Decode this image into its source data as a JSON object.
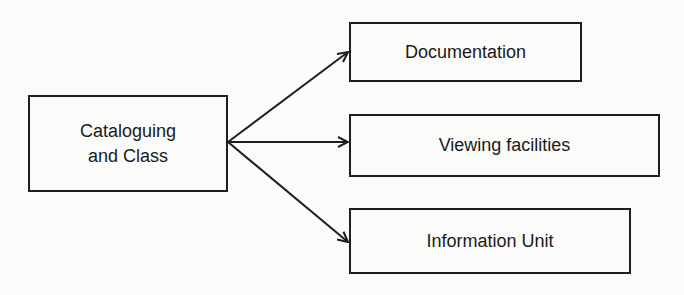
{
  "diagram": {
    "source_node": {
      "label_line1": "Cataloguing",
      "label_line2": "and Class"
    },
    "target_nodes": [
      {
        "label": "Documentation"
      },
      {
        "label": "Viewing facilities"
      },
      {
        "label": "Information Unit"
      }
    ],
    "edges": [
      {
        "from": "Cataloguing and Class",
        "to": "Documentation"
      },
      {
        "from": "Cataloguing and Class",
        "to": "Viewing facilities"
      },
      {
        "from": "Cataloguing and Class",
        "to": "Information Unit"
      }
    ],
    "colors": {
      "stroke": "#1e1e1e",
      "background": "#fbfbf9"
    }
  }
}
